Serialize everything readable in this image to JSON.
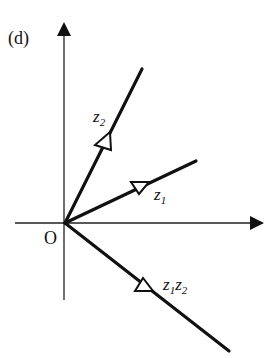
{
  "figure": {
    "panel_label": "(d)",
    "origin_label": "O",
    "vectors": [
      {
        "name": "z2",
        "label_main": "z",
        "label_sub": "2"
      },
      {
        "name": "z1",
        "label_main": "z",
        "label_sub": "1"
      },
      {
        "name": "z1z2",
        "label_main1": "z",
        "label_sub1": "1",
        "label_main2": "z",
        "label_sub2": "2"
      }
    ]
  },
  "colors": {
    "stroke": "#111111",
    "background": "#ffffff"
  }
}
